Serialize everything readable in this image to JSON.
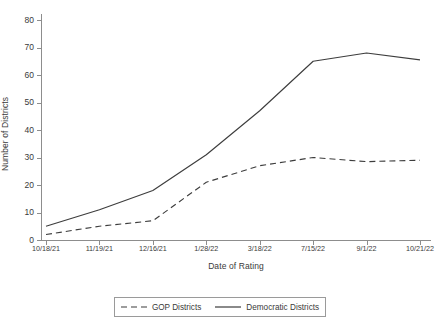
{
  "chart_data": {
    "type": "line",
    "title": "",
    "xlabel": "Date of Rating",
    "ylabel": "Number of Districts",
    "categories": [
      "10/18/21",
      "11/19/21",
      "12/16/21",
      "1/28/22",
      "3/18/22",
      "7/15/22",
      "9/1/22",
      "10/21/22"
    ],
    "ylim": [
      0,
      80
    ],
    "yticks": [
      0,
      10,
      20,
      30,
      40,
      50,
      60,
      70,
      80
    ],
    "grid": false,
    "legend_position": "bottom-center",
    "series": [
      {
        "name": "GOP Districts",
        "style": "dashed",
        "color": "#3d3d3d",
        "values": [
          2,
          5,
          7,
          21,
          27,
          30,
          28.5,
          29
        ]
      },
      {
        "name": "Democratic Districts",
        "style": "solid",
        "color": "#3d3d3d",
        "values": [
          5,
          11,
          18,
          31,
          47,
          65,
          68,
          65.5
        ]
      }
    ]
  },
  "axes": {
    "y_title": "Number of Districts",
    "x_title": "Date of Rating",
    "y_tick_labels": [
      "0",
      "10",
      "20",
      "30",
      "40",
      "50",
      "60",
      "70",
      "80"
    ],
    "x_tick_labels": [
      "10/18/21",
      "11/19/21",
      "12/16/21",
      "1/28/22",
      "3/18/22",
      "7/15/22",
      "9/1/22",
      "10/21/22"
    ]
  },
  "legend": {
    "entries": [
      {
        "label": "GOP Districts",
        "dash": "dashed"
      },
      {
        "label": "Democratic Districts",
        "dash": "solid"
      }
    ]
  }
}
